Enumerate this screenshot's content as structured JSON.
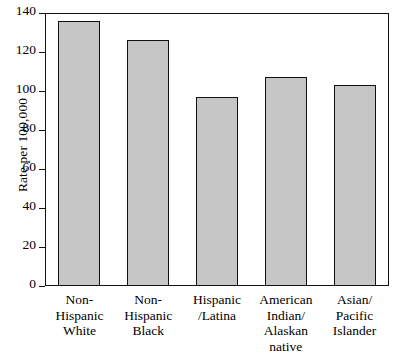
{
  "chart_data": {
    "type": "bar",
    "title": "",
    "subtitle": "",
    "xlabel": "",
    "ylabel": "Rate per 100,000",
    "ylim": [
      0,
      140
    ],
    "ytick_values": [
      0,
      20,
      40,
      60,
      80,
      100,
      120,
      140
    ],
    "ytick_labels": [
      "0",
      "20",
      "40",
      "60",
      "80",
      "100",
      "120",
      "140"
    ],
    "grid": false,
    "legend": null,
    "categories": [
      "Non-\nHispanic\nWhite",
      "Non-\nHispanic\nBlack",
      "Hispanic\n/Latina",
      "American\nIndian/\nAlaskan\nnative",
      "Asian/\nPacific\nIslander"
    ],
    "values": [
      136,
      126,
      97,
      107,
      103
    ],
    "bar_fill_color": "#c6c6c6",
    "bar_edge_color": "#111111",
    "background_color": "#ffffff"
  }
}
